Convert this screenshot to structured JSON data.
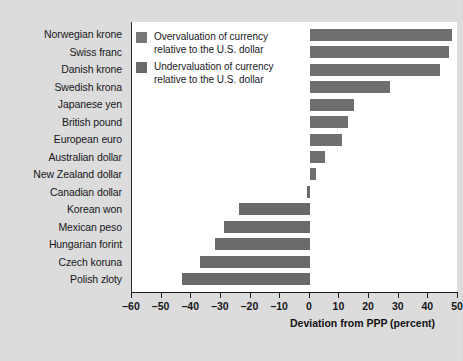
{
  "chart_data": {
    "type": "bar",
    "orientation": "horizontal",
    "title": "",
    "xlabel": "Deviation from PPP (percent)",
    "ylabel": "",
    "xlim": [
      -60,
      50
    ],
    "xticks": [
      -60,
      -50,
      -40,
      -30,
      -20,
      -10,
      0,
      10,
      20,
      30,
      40,
      50
    ],
    "xtick_labels": [
      "–60",
      "–50",
      "–40",
      "–30",
      "–20",
      "–10",
      "0",
      "10",
      "20",
      "30",
      "40",
      "50"
    ],
    "grid": false,
    "legend_position": "top-left-inside",
    "categories": [
      "Norwegian krone",
      "Swiss franc",
      "Danish krone",
      "Swedish krona",
      "Japanese yen",
      "British pound",
      "European euro",
      "Australian dollar",
      "New Zealand dollar",
      "Canadian dollar",
      "Korean won",
      "Mexican peso",
      "Hungarian forint",
      "Czech koruna",
      "Polish zloty"
    ],
    "values": [
      48,
      47,
      44,
      27,
      15,
      13,
      11,
      5,
      2,
      -1,
      -24,
      -29,
      -32,
      -37,
      -43
    ],
    "series": [
      {
        "name": "Deviation from PPP (percent)",
        "values": [
          48,
          47,
          44,
          27,
          15,
          13,
          11,
          5,
          2,
          -1,
          -24,
          -29,
          -32,
          -37,
          -43
        ]
      }
    ],
    "legend": [
      {
        "label": "Overvaluation of currency\nrelative to the U.S. dollar",
        "color": "#787878"
      },
      {
        "label": "Undervaluation of currency\nrelative to the U.S. dollar",
        "color": "#6a6a6a"
      }
    ],
    "colors": {
      "bar_positive": "#6f6f6f",
      "bar_negative": "#6a6a6a",
      "plot_background": "#ffffff",
      "figure_background": "#dcdcdc",
      "axis": "#1d1d1d"
    }
  }
}
